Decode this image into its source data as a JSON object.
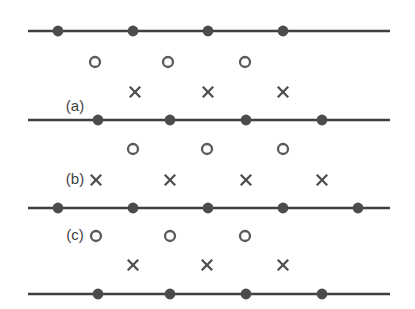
{
  "figure": {
    "background_color": "#ffffff",
    "width": 415,
    "height": 309,
    "colors": {
      "line": "#3f3f3f",
      "atom": "#4c4c4c",
      "circle": "#5a5a5a",
      "cross": "#4f4f4f",
      "label": "#3f3f3f"
    },
    "labels": [
      {
        "text": "(a)",
        "x": 75,
        "y": 107
      },
      {
        "text": "(b)",
        "x": 75,
        "y": 180
      },
      {
        "text": "(c)",
        "x": 75,
        "y": 236
      }
    ],
    "lines": [
      {
        "name": "lattice-line-1",
        "x1": 28,
        "x2": 390,
        "y": 31,
        "atoms": [
          58,
          133,
          208,
          283
        ]
      },
      {
        "name": "lattice-line-2",
        "x1": 28,
        "x2": 390,
        "y": 120,
        "atoms": [
          98,
          170,
          246,
          322
        ]
      },
      {
        "name": "lattice-line-3",
        "x1": 28,
        "x2": 390,
        "y": 208,
        "atoms": [
          58,
          133,
          208,
          283,
          358
        ]
      },
      {
        "name": "lattice-line-4",
        "x1": 28,
        "x2": 390,
        "y": 294,
        "atoms": [
          98,
          170,
          246,
          322
        ]
      }
    ],
    "circle_rows": [
      {
        "name": "circle-row-1",
        "y": 62,
        "x": [
          95,
          168,
          245
        ]
      },
      {
        "name": "circle-row-2",
        "y": 149,
        "x": [
          133,
          207,
          283
        ]
      },
      {
        "name": "circle-row-3",
        "y": 236,
        "x": [
          96,
          170,
          245
        ]
      }
    ],
    "cross_rows": [
      {
        "name": "cross-row-1",
        "y": 92,
        "x": [
          135,
          208,
          283
        ]
      },
      {
        "name": "cross-row-2",
        "y": 180,
        "x": [
          96,
          170,
          246,
          322
        ]
      },
      {
        "name": "cross-row-3",
        "y": 265,
        "x": [
          133,
          207,
          283
        ]
      }
    ],
    "marker_sizes": {
      "atom_radius": 5.4,
      "circle_radius": 5.0,
      "cross_half": 5.2
    }
  }
}
